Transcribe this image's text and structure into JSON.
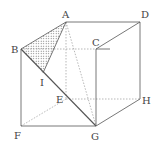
{
  "diagram": {
    "type": "cube-geometry",
    "vertices": {
      "A": {
        "label": "A",
        "x": 66,
        "y": 22
      },
      "B": {
        "label": "B",
        "x": 21,
        "y": 49
      },
      "C": {
        "label": "C",
        "x": 96,
        "y": 49
      },
      "D": {
        "label": "D",
        "x": 140,
        "y": 22
      },
      "E": {
        "label": "E",
        "x": 66,
        "y": 99
      },
      "F": {
        "label": "F",
        "x": 21,
        "y": 126
      },
      "G": {
        "label": "G",
        "x": 96,
        "y": 126
      },
      "H": {
        "label": "H",
        "x": 140,
        "y": 99
      },
      "I": {
        "label": "I",
        "x": 43,
        "y": 73
      }
    },
    "solid_edges": [
      "AD",
      "AB",
      "BC",
      "CD",
      "DH",
      "HG",
      "CG",
      "BF",
      "FG",
      "BG",
      "AI"
    ],
    "hidden_edges": [
      "AE",
      "EF",
      "EH",
      "AG"
    ],
    "shaded_region": [
      "A",
      "B",
      "I"
    ],
    "colors": {
      "line": "#555555",
      "hidden": "#888888",
      "shade": "#666666"
    }
  }
}
